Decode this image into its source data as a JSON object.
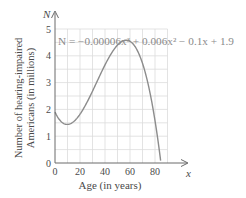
{
  "chart_data": {
    "type": "line",
    "title": "",
    "equation": "N = −0.00006x³ + 0.006x² − 0.1x + 1.9",
    "xlabel": "Age (in years)",
    "ylabel_lines": [
      "Number of hearing-impaired",
      "Americans (in millions)"
    ],
    "x_axis_var": "x",
    "y_axis_var": "N",
    "xlim": [
      0,
      90
    ],
    "ylim": [
      0,
      5
    ],
    "x_ticks": [
      0,
      20,
      40,
      60,
      80
    ],
    "y_ticks": [
      0,
      1,
      2,
      3,
      4,
      5
    ],
    "grid": true,
    "grid_x_step": 10,
    "grid_y_step": 0.5,
    "series": [
      {
        "name": "N = −0.00006x³ + 0.006x² − 0.1x + 1.9",
        "x": [
          0,
          10,
          20,
          30,
          40,
          50,
          57,
          60,
          70,
          80,
          84
        ],
        "values": [
          1.9,
          1.44,
          1.82,
          2.68,
          3.66,
          4.4,
          4.58,
          4.54,
          3.72,
          1.58,
          0.28
        ]
      }
    ],
    "colors": {
      "curve": "#8c8c8c",
      "grid": "#dcdcdc",
      "axis": "#6a6a6a",
      "text": "#4a4a4a"
    }
  }
}
